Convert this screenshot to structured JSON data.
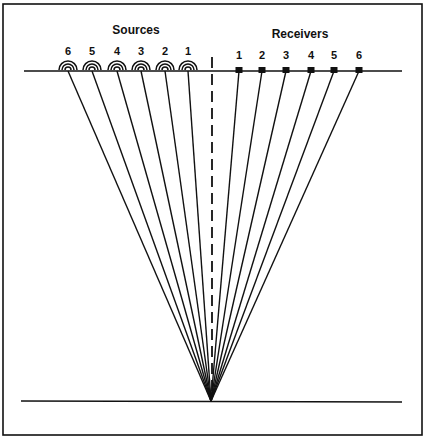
{
  "diagram": {
    "titles": {
      "sources": "Sources",
      "receivers": "Receivers"
    },
    "colors": {
      "ink": "#111111",
      "background": "#ffffff"
    },
    "frame": {
      "x": 3,
      "y": 4,
      "width": 419,
      "height": 431
    },
    "surface_line": {
      "x1": 24,
      "x2": 402,
      "y": 71
    },
    "reflector_line": {
      "x1": 21,
      "x2": 402,
      "y": 401
    },
    "midpoint": {
      "x": 211,
      "y": 401
    },
    "center_dashed_line": {
      "x": 212,
      "y1": 57,
      "y2": 398
    },
    "sources": [
      {
        "label": "6",
        "x": 68
      },
      {
        "label": "5",
        "x": 92
      },
      {
        "label": "4",
        "x": 117
      },
      {
        "label": "3",
        "x": 141
      },
      {
        "label": "2",
        "x": 165
      },
      {
        "label": "1",
        "x": 188
      }
    ],
    "receivers": [
      {
        "label": "1",
        "x": 239
      },
      {
        "label": "2",
        "x": 262
      },
      {
        "label": "3",
        "x": 286
      },
      {
        "label": "4",
        "x": 311
      },
      {
        "label": "5",
        "x": 334
      },
      {
        "label": "6",
        "x": 359
      }
    ],
    "title_positions": {
      "sources": {
        "x": 136,
        "y": 24
      },
      "receivers": {
        "x": 300,
        "y": 28
      }
    }
  }
}
